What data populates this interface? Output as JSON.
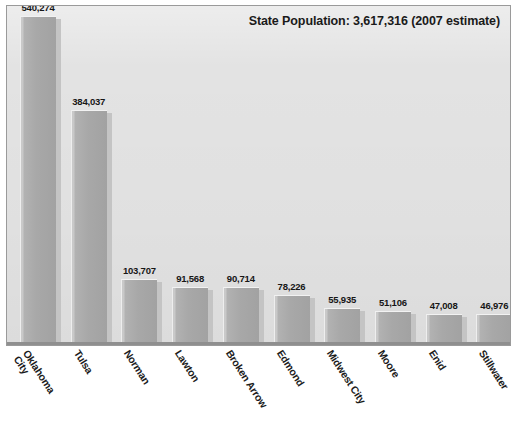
{
  "chart_data": {
    "type": "bar",
    "title": "State Population: 3,617,316 (2007 estimate)",
    "xlabel": "",
    "ylabel": "",
    "ylim": [
      0,
      560000
    ],
    "grid": false,
    "legend": false,
    "categories": [
      "Oklahoma City",
      "Tulsa",
      "Norman",
      "Lawton",
      "Broken Arrow",
      "Edmond",
      "Midwest City",
      "Moore",
      "Enid",
      "Stillwater"
    ],
    "values": [
      540274,
      384037,
      103707,
      91568,
      90714,
      78226,
      55935,
      51106,
      47008,
      46976
    ],
    "value_labels": [
      "540,274",
      "384,037",
      "103,707",
      "91,568",
      "90,714",
      "78,226",
      "55,935",
      "51,106",
      "47,008",
      "46,976"
    ],
    "category_label_lines": [
      [
        "Oklahoma",
        "City"
      ],
      [
        "Tulsa"
      ],
      [
        "Norman"
      ],
      [
        "Lawton"
      ],
      [
        "Broken Arrow"
      ],
      [
        "Edmond"
      ],
      [
        "Midwest City"
      ],
      [
        "Moore"
      ],
      [
        "Enid"
      ],
      [
        "Stillwater"
      ]
    ],
    "colors": {
      "bar_fill": "#a8a8a8",
      "bar_highlight": "#c9c9c9",
      "bar_shadow": "#c4c4c4",
      "plot_background": "#e3e3e3",
      "frame_border": "#9a9a9a",
      "axis_line": "#8f8f8f",
      "text": "#1a1a1a",
      "page_background": "#ffffff"
    }
  }
}
